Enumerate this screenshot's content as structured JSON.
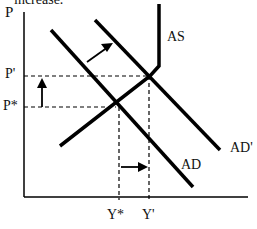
{
  "header": {
    "truncated_text": "increase."
  },
  "diagram": {
    "type": "AD-AS shift diagram",
    "axes": {
      "y_label": "P",
      "x_tick_labels": [
        "Y*",
        "Y'"
      ],
      "y_tick_labels": [
        "P'",
        "P*"
      ]
    },
    "curves": [
      {
        "name": "AS",
        "label": "AS",
        "shape": "upward sloping then vertical"
      },
      {
        "name": "AD",
        "label": "AD",
        "shape": "downward sloping"
      },
      {
        "name": "AD_prime",
        "label": "AD'",
        "shape": "downward sloping, shifted right"
      }
    ],
    "arrows": [
      {
        "name": "ad-shift-arrow",
        "direction": "up-right",
        "meaning": "AD shifts to AD'"
      },
      {
        "name": "price-increase-arrow",
        "direction": "up",
        "meaning": "P* rises to P'"
      },
      {
        "name": "output-increase-arrow",
        "direction": "right",
        "meaning": "Y* rises to Y'"
      }
    ],
    "equilibria": [
      {
        "name": "initial",
        "price": "P*",
        "output": "Y*"
      },
      {
        "name": "new",
        "price": "P'",
        "output": "Y'"
      }
    ],
    "line_color": "#000000"
  }
}
